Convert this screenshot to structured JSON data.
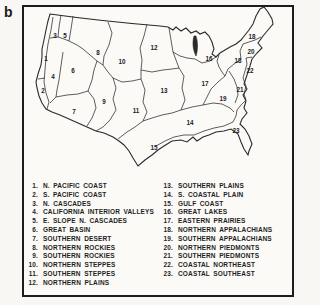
{
  "figure": {
    "panel_label": "b"
  },
  "colors": {
    "ink": "#1f1f1f",
    "paper": "#fbfaf7",
    "page_background": "#f8f7f4"
  },
  "map": {
    "labels": [
      {
        "t": "1",
        "x": 46,
        "y": 59
      },
      {
        "t": "2",
        "x": 43,
        "y": 91
      },
      {
        "t": "3",
        "x": 55,
        "y": 36
      },
      {
        "t": "4",
        "x": 53,
        "y": 77
      },
      {
        "t": "5",
        "x": 65,
        "y": 36
      },
      {
        "t": "6",
        "x": 73,
        "y": 71
      },
      {
        "t": "7",
        "x": 74,
        "y": 112
      },
      {
        "t": "8",
        "x": 98,
        "y": 53
      },
      {
        "t": "9",
        "x": 104,
        "y": 102
      },
      {
        "t": "10",
        "x": 122,
        "y": 62
      },
      {
        "t": "11",
        "x": 136,
        "y": 111
      },
      {
        "t": "12",
        "x": 154,
        "y": 48
      },
      {
        "t": "13",
        "x": 164,
        "y": 91
      },
      {
        "t": "14",
        "x": 190,
        "y": 123
      },
      {
        "t": "15",
        "x": 154,
        "y": 148
      },
      {
        "t": "16",
        "x": 209,
        "y": 59
      },
      {
        "t": "17",
        "x": 205,
        "y": 84
      },
      {
        "t": "18",
        "x": 252,
        "y": 37
      },
      {
        "t": "18",
        "x": 238,
        "y": 61
      },
      {
        "t": "19",
        "x": 223,
        "y": 99
      },
      {
        "t": "20",
        "x": 251,
        "y": 52
      },
      {
        "t": "21",
        "x": 240,
        "y": 90
      },
      {
        "t": "22",
        "x": 250,
        "y": 71
      },
      {
        "t": "23",
        "x": 236,
        "y": 131
      }
    ]
  },
  "legend": {
    "left": [
      {
        "num": "1.",
        "label": "N. PACIFIC COAST"
      },
      {
        "num": "2.",
        "label": "S. PACIFIC COAST"
      },
      {
        "num": "3.",
        "label": "N. CASCADES"
      },
      {
        "num": "4.",
        "label": "CALIFORNIA INTERIOR VALLEYS"
      },
      {
        "num": "5.",
        "label": "E. SLOPE N. CASCADES"
      },
      {
        "num": "6.",
        "label": "GREAT BASIN"
      },
      {
        "num": "7.",
        "label": "SOUTHERN DESERT"
      },
      {
        "num": "8.",
        "label": "NORTHERN ROCKIES"
      },
      {
        "num": "9.",
        "label": "SOUTHERN ROCKIES"
      },
      {
        "num": "10.",
        "label": "NORTHERN STEPPES"
      },
      {
        "num": "11.",
        "label": "SOUTHERN STEPPES"
      },
      {
        "num": "12.",
        "label": "NORTHERN PLAINS"
      }
    ],
    "right": [
      {
        "num": "13.",
        "label": "SOUTHERN PLAINS"
      },
      {
        "num": "14.",
        "label": "S. COASTAL PLAIN"
      },
      {
        "num": "15.",
        "label": "GULF COAST"
      },
      {
        "num": "16.",
        "label": "GREAT LAKES"
      },
      {
        "num": "17.",
        "label": "EASTERN PRAIRIES"
      },
      {
        "num": "18.",
        "label": "NORTHERN APPALACHIANS"
      },
      {
        "num": "19.",
        "label": "SOUTHERN APPALACHIANS"
      },
      {
        "num": "20.",
        "label": "NORTHERN PIEDMONTS"
      },
      {
        "num": "21.",
        "label": "SOUTHERN PIEDMONTS"
      },
      {
        "num": "22.",
        "label": "COASTAL NORTHEAST"
      },
      {
        "num": "23.",
        "label": "COASTAL SOUTHEAST"
      }
    ]
  }
}
